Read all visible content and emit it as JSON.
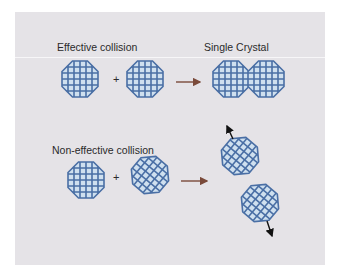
{
  "labels": {
    "effective": "Effective collision",
    "single_crystal": "Single Crystal",
    "non_effective": "Non-effective collision",
    "plus": "+"
  },
  "colors": {
    "panel": "#e5e3e7",
    "crystal_fill": "#cfe0ef",
    "crystal_stroke": "#4a6fa5",
    "reaction_arrow": "#7a4a3a",
    "motion_arrow": "#111111",
    "text": "#2a2a2a"
  },
  "rows": [
    {
      "name": "effective-collision",
      "reactants": [
        "crystal-aligned",
        "crystal-aligned"
      ],
      "product": "single-crystal (two fused aligned crystals)"
    },
    {
      "name": "non-effective-collision",
      "reactants": [
        "crystal-aligned",
        "crystal-rotated"
      ],
      "product": "two separate crystals bouncing apart"
    }
  ]
}
